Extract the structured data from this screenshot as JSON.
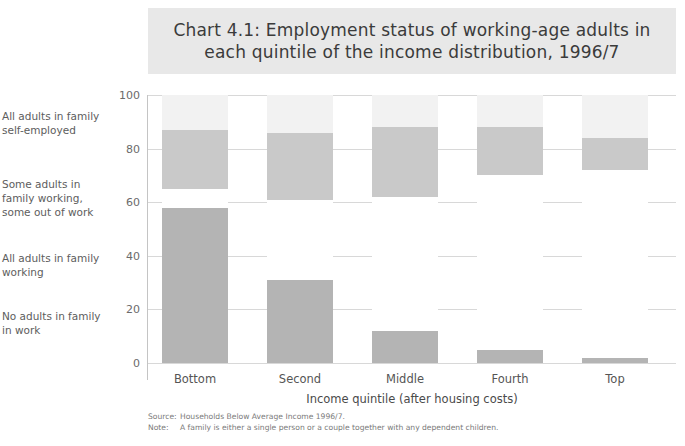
{
  "title": "Chart 4.1: Employment status of working-age adults in each quintile of the income distribution, 1996/7",
  "axis": {
    "y_title": "Percentage",
    "x_title": "Income quintile (after housing costs)",
    "y_ticks": [
      "0",
      "20",
      "40",
      "60",
      "80",
      "100"
    ]
  },
  "legend_labels": [
    "All adults in family self-employed",
    "Some adults in family working, some out of work",
    "All adults in family working",
    "No adults in family in work"
  ],
  "footnotes": [
    {
      "key": "Source:",
      "value": "Households Below Average Income 1996/7."
    },
    {
      "key": "Note:",
      "value": "A family is either a single person or a couple together with any dependent children."
    }
  ],
  "colors": {
    "banner": "#e8e8e8",
    "no_adults_working": "#b4b4b4",
    "all_adults_working": "#ffffff",
    "some_adults_working": "#c9c9c9",
    "self_employed": "#f2f2f2",
    "gridline": "#d8d8d8",
    "text": "#5a5a5a"
  },
  "chart_data": {
    "type": "bar",
    "stacked": true,
    "title": "Chart 4.1: Employment status of working-age adults in each quintile of the income distribution, 1996/7",
    "xlabel": "Income quintile (after housing costs)",
    "ylabel": "Percentage",
    "ylim": [
      0,
      100
    ],
    "grid": true,
    "legend_position": "left",
    "categories": [
      "Bottom",
      "Second",
      "Middle",
      "Fourth",
      "Top"
    ],
    "series": [
      {
        "name": "No adults in family in work",
        "color": "#b4b4b4",
        "values": [
          58,
          31,
          12,
          5,
          2
        ]
      },
      {
        "name": "All adults in family working",
        "color": "#ffffff",
        "values": [
          7,
          30,
          50,
          65,
          70
        ]
      },
      {
        "name": "Some adults in family working, some out of work",
        "color": "#c9c9c9",
        "values": [
          22,
          25,
          26,
          18,
          12
        ]
      },
      {
        "name": "All adults in family self-employed",
        "color": "#f2f2f2",
        "values": [
          13,
          14,
          12,
          12,
          16
        ]
      }
    ]
  }
}
